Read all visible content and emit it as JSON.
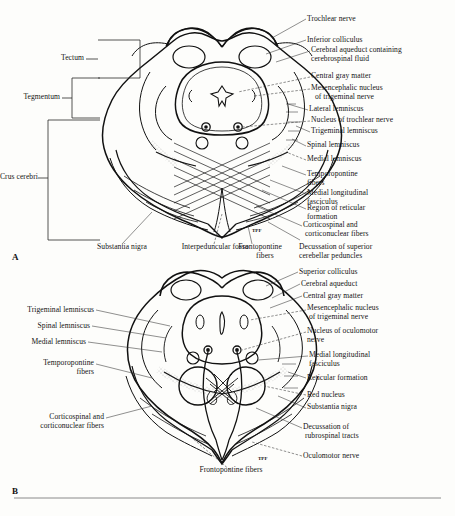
{
  "figure": {
    "panels": [
      {
        "letter": "A",
        "name": "midbrain-inferior-colliculus-level",
        "brackets": [
          {
            "label": "Tectum",
            "name": "bracket-tectum"
          },
          {
            "label": "Tegmentum",
            "name": "bracket-tegmentum"
          },
          {
            "label": "Crus cerebri",
            "name": "bracket-crus-cerebri"
          }
        ],
        "labels_right": [
          {
            "label": "Trochlear nerve",
            "name": "label-trochlear-nerve"
          },
          {
            "label": "Inferior colliculus",
            "name": "label-inferior-colliculus"
          },
          {
            "label": "Cerebral aqueduct containing\ncerebrospinal fluid",
            "name": "label-cerebral-aqueduct"
          },
          {
            "label": "Central gray matter",
            "name": "label-central-gray-matter"
          },
          {
            "label": "Mesencephalic nucleus\n  of trigeminal nerve",
            "name": "label-mesencephalic-nucleus-trigeminal"
          },
          {
            "label": "Lateral lemniscus",
            "name": "label-lateral-lemniscus"
          },
          {
            "label": "Nucleus of trochlear nerve",
            "name": "label-nucleus-trochlear-nerve"
          },
          {
            "label": "Trigeminal lemniscus",
            "name": "label-trigeminal-lemniscus"
          },
          {
            "label": "Spinal lemniscus",
            "name": "label-spinal-lemniscus"
          },
          {
            "label": "Medial lemniscus",
            "name": "label-medial-lemniscus"
          },
          {
            "label": "Temporopontine\nfibers",
            "name": "label-temporopontine-fibers"
          },
          {
            "label": "Medial longitudinal\nfasciculus",
            "name": "label-medial-longitudinal-fasciculus"
          },
          {
            "label": "Region of reticular\nformation",
            "name": "label-region-reticular-formation"
          },
          {
            "label": "Corticospinal and\n corticonuclear fibers",
            "name": "label-corticospinal-corticonuclear-fibers"
          }
        ],
        "labels_bottom": [
          {
            "label": "Substantia nigra",
            "name": "label-substantia-nigra"
          },
          {
            "label": "Interpeduncular fossa",
            "name": "label-interpeduncular-fossa"
          },
          {
            "label": "Frontopontine\n     fibers",
            "name": "label-frontopontine-fibers"
          },
          {
            "label": "Decussation of superior\ncerebellar peduncles",
            "name": "label-decussation-superior-cerebellar-peduncles"
          }
        ]
      },
      {
        "letter": "B",
        "name": "midbrain-superior-colliculus-level",
        "labels_right": [
          {
            "label": "Superior colliculus",
            "name": "label-superior-colliculus"
          },
          {
            "label": "Cerebral aqueduct",
            "name": "label-cerebral-aqueduct-b"
          },
          {
            "label": "Central gray matter",
            "name": "label-central-gray-matter-b"
          },
          {
            "label": "Mesencephalic nucleus\n of trigeminal nerve",
            "name": "label-mesencephalic-nucleus-trigeminal-b"
          },
          {
            "label": "Nucleus of oculomotor\nnerve",
            "name": "label-nucleus-oculomotor-nerve"
          },
          {
            "label": "Medial longitudinal\nfasciculus",
            "name": "label-medial-longitudinal-fasciculus-b"
          },
          {
            "label": "Reticular formation",
            "name": "label-reticular-formation-b"
          },
          {
            "label": "Red nucleus",
            "name": "label-red-nucleus"
          },
          {
            "label": "Substantia nigra",
            "name": "label-substantia-nigra-b"
          },
          {
            "label": "Decussation of\n rubrospinal tracts",
            "name": "label-decussation-rubrospinal-tracts"
          },
          {
            "label": "Oculomotor nerve",
            "name": "label-oculomotor-nerve"
          }
        ],
        "labels_left": [
          {
            "label": "Trigeminal lemniscus",
            "name": "label-trigeminal-lemniscus-b"
          },
          {
            "label": "Spinal lemniscus",
            "name": "label-spinal-lemniscus-b"
          },
          {
            "label": "Medial lemniscus",
            "name": "label-medial-lemniscus-b"
          },
          {
            "label": "Temporopontine\n       fibers",
            "name": "label-temporopontine-fibers-b"
          },
          {
            "label": "Corticospinal and\ncorticonuclear fibers",
            "name": "label-corticospinal-corticonuclear-fibers-b"
          }
        ],
        "labels_bottom": [
          {
            "label": "Frontopontine fibers",
            "name": "label-frontopontine-fibers-b"
          }
        ]
      }
    ],
    "colors": {
      "ink": "#141414",
      "outline": "#111111",
      "leader": "#333333",
      "bracket": "#2a2a2a",
      "rule": "#8a8a8a",
      "paper": "#fdfdfb"
    },
    "inline_marks": [
      {
        "label": "TPF",
        "name": "inline-mark-tpf-a"
      },
      {
        "label": "TPF",
        "name": "inline-mark-tpf-b"
      }
    ]
  }
}
